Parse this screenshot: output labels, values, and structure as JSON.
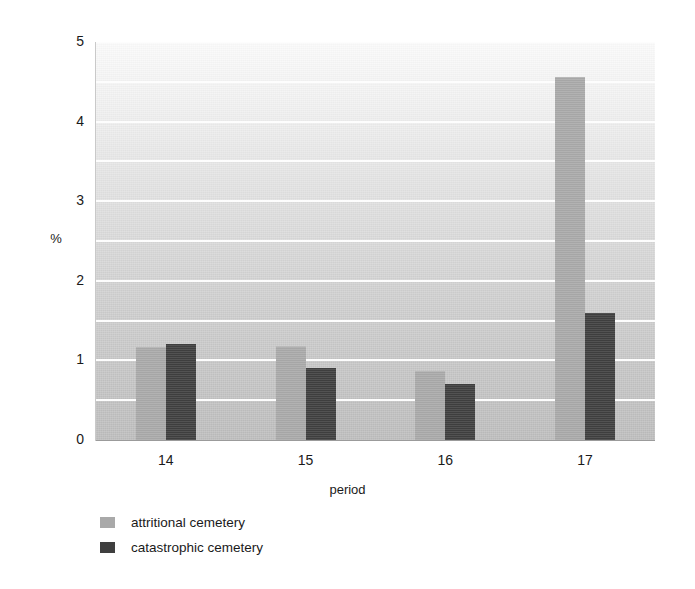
{
  "chart_data": {
    "type": "bar",
    "title": "",
    "xlabel": "period",
    "ylabel": "%",
    "categories": [
      "14",
      "15",
      "16",
      "17"
    ],
    "series": [
      {
        "name": "attritional cemetery",
        "color": "#a9a9a9",
        "values": [
          1.15,
          1.17,
          0.86,
          4.55
        ]
      },
      {
        "name": "catastrophic cemetery",
        "color": "#3f3f3f",
        "values": [
          1.2,
          0.9,
          0.7,
          1.6
        ]
      }
    ],
    "ylim": [
      0,
      5
    ],
    "y_major_ticks": [
      0,
      1,
      2,
      3,
      4,
      5
    ],
    "y_minor_ticks": [
      0.5,
      1.5,
      2.5,
      3.5,
      4.5
    ],
    "y_tick_labels": [
      "0",
      "1",
      "2",
      "3",
      "4",
      "5"
    ],
    "grid": true,
    "grid_color": "#fdfdfd",
    "legend_position": "below-left",
    "plot_background": "vertical gradient light-gray top to mid-gray bottom"
  },
  "axes": {
    "y_title": "%",
    "x_title": "period"
  },
  "legend": {
    "entries": [
      {
        "label": "attritional cemetery",
        "swatch": "#a9a9a9"
      },
      {
        "label": "catastrophic cemetery",
        "swatch": "#3f3f3f"
      }
    ]
  }
}
